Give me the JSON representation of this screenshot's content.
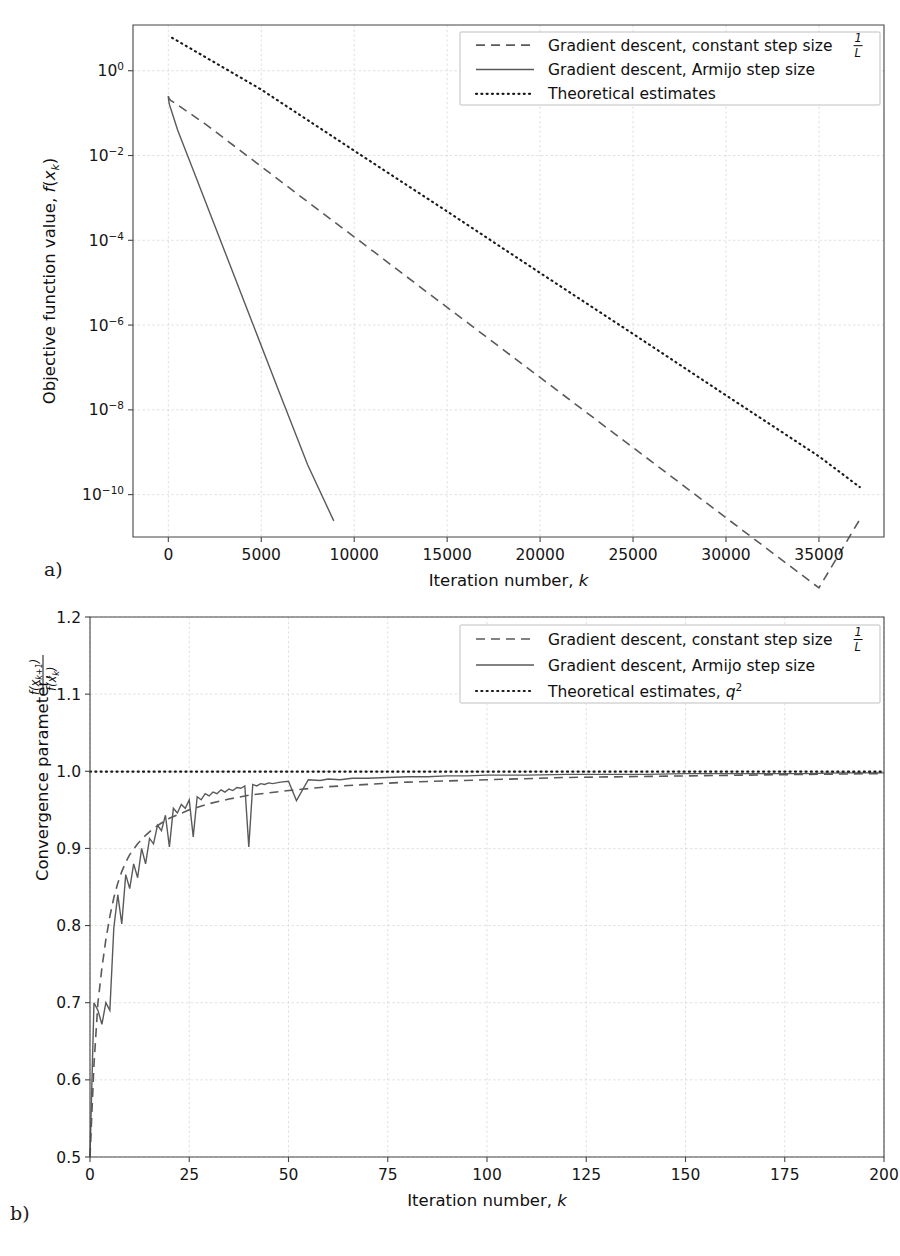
{
  "figure": {
    "panels": [
      {
        "key": "a",
        "label": "a)",
        "legend_items": [
          {
            "style": "dashed",
            "label": "Gradient descent, constant step size",
            "suffix_fraction": {
              "numerator": "1",
              "denominator": "L"
            }
          },
          {
            "style": "solid",
            "label": "Gradient descent, Armijo step size",
            "suffix_fraction": null
          },
          {
            "style": "dotted",
            "label": "Theoretical estimates",
            "suffix_fraction": null
          }
        ]
      },
      {
        "key": "b",
        "label": "b)",
        "legend_items": [
          {
            "style": "dashed",
            "label": "Gradient descent, constant step size",
            "suffix_fraction": {
              "numerator": "1",
              "denominator": "L"
            }
          },
          {
            "style": "solid",
            "label": "Gradient descent, Armijo step size",
            "suffix_fraction": null
          },
          {
            "style": "dotted",
            "label": "Theoretical estimates, q²",
            "suffix_fraction": null
          }
        ]
      }
    ]
  },
  "chart_data": [
    {
      "panel": "a",
      "type": "line",
      "title": "",
      "xlabel": "Iteration number, k",
      "ylabel": "Objective function value, f(xₖ)",
      "yscale": "log",
      "xscale": "linear",
      "xlim": [
        -1900,
        38500
      ],
      "ylim": [
        1e-11,
        12
      ],
      "xticks": [
        0,
        5000,
        10000,
        15000,
        20000,
        25000,
        30000,
        35000
      ],
      "xticklabels": [
        "0",
        "5000",
        "10000",
        "15000",
        "20000",
        "25000",
        "30000",
        "35000"
      ],
      "yticks": [
        1,
        0.01,
        0.0001,
        1e-06,
        1e-08,
        1e-10
      ],
      "yticklabels": [
        "10⁰",
        "10⁻²",
        "10⁻⁴",
        "10⁻⁶",
        "10⁻⁸",
        "10⁻¹⁰"
      ],
      "grid": true,
      "legend_position": "upper right",
      "series": [
        {
          "name": "Gradient descent, constant step size 1/L",
          "style": "dashed",
          "color": "#5a5a5a",
          "x": [
            0,
            40,
            120,
            300,
            2000,
            5000,
            8000,
            11000,
            14000,
            17000,
            20000,
            23000,
            26000,
            29000,
            32000,
            35000,
            37200
          ],
          "y": [
            0.25,
            0.22,
            0.2,
            0.18,
            0.055,
            0.0055,
            0.00055,
            5.6e-05,
            5.6e-06,
            5.7e-07,
            5.8e-08,
            5.9e-09,
            6e-10,
            6.1e-11,
            6.2e-12,
            6.3e-13,
            2.6e-11
          ]
        },
        {
          "name": "Gradient descent, Armijo step size",
          "style": "solid",
          "color": "#5a5a5a",
          "x": [
            0,
            20,
            60,
            150,
            500,
            1500,
            3000,
            4500,
            6000,
            7500,
            8900
          ],
          "y": [
            0.25,
            0.2,
            0.16,
            0.12,
            0.04,
            0.003,
            6e-05,
            1.2e-06,
            2.4e-08,
            5e-10,
            2.4e-11
          ]
        },
        {
          "name": "Theoretical estimates",
          "style": "dotted",
          "color": "#1a1a1a",
          "x": [
            200,
            5000,
            10000,
            15000,
            20000,
            25000,
            30000,
            35000,
            37200
          ],
          "y": [
            6.0,
            0.36,
            0.013,
            0.00048,
            1.7e-05,
            6.2e-07,
            2.2e-08,
            8e-10,
            1.5e-10
          ]
        }
      ]
    },
    {
      "panel": "b",
      "type": "line",
      "title": "",
      "xlabel": "Iteration number, k",
      "ylabel": "Convergence parameter, f(xₖ₊₁)/f(xₖ)",
      "yscale": "linear",
      "xscale": "linear",
      "xlim": [
        0,
        200
      ],
      "ylim": [
        0.5,
        1.2
      ],
      "xticks": [
        0,
        25,
        50,
        75,
        100,
        125,
        150,
        175,
        200
      ],
      "xticklabels": [
        "0",
        "25",
        "50",
        "75",
        "100",
        "125",
        "150",
        "175",
        "200"
      ],
      "yticks": [
        0.5,
        0.6,
        0.7,
        0.8,
        0.9,
        1.0,
        1.1,
        1.2
      ],
      "yticklabels": [
        "0.5",
        "0.6",
        "0.7",
        "0.8",
        "0.9",
        "1.0",
        "1.1",
        "1.2"
      ],
      "grid": true,
      "legend_position": "upper right",
      "series": [
        {
          "name": "Gradient descent, constant step size 1/L",
          "style": "dashed",
          "color": "#5a5a5a",
          "x": [
            0,
            1,
            2,
            3,
            4,
            5,
            6,
            7,
            8,
            9,
            10,
            12,
            14,
            16,
            18,
            20,
            25,
            30,
            35,
            40,
            50,
            60,
            70,
            80,
            100,
            120,
            150,
            180,
            200
          ],
          "y": [
            0.5,
            0.62,
            0.7,
            0.745,
            0.782,
            0.812,
            0.836,
            0.855,
            0.87,
            0.882,
            0.892,
            0.906,
            0.917,
            0.926,
            0.933,
            0.939,
            0.95,
            0.958,
            0.964,
            0.969,
            0.975,
            0.98,
            0.983,
            0.986,
            0.989,
            0.992,
            0.994,
            0.996,
            0.997
          ]
        },
        {
          "name": "Gradient descent, Armijo step size",
          "style": "solid",
          "color": "#5a5a5a",
          "x": [
            0,
            1,
            2,
            3,
            4,
            5,
            6,
            7,
            8,
            9,
            10,
            11,
            12,
            13,
            14,
            15,
            16,
            17,
            18,
            19,
            20,
            21,
            22,
            23,
            24,
            25,
            26,
            27,
            28,
            29,
            30,
            31,
            32,
            33,
            34,
            35,
            36,
            37,
            38,
            39,
            40,
            41,
            42,
            43,
            44,
            45,
            46,
            48,
            50,
            52,
            55,
            58,
            60,
            63,
            66,
            70,
            75,
            80,
            85,
            90,
            95,
            100,
            110,
            120,
            130,
            140,
            150,
            160,
            170,
            180,
            190,
            200
          ],
          "y": [
            0.5,
            0.7,
            0.69,
            0.672,
            0.7,
            0.69,
            0.797,
            0.84,
            0.802,
            0.866,
            0.848,
            0.88,
            0.862,
            0.9,
            0.88,
            0.913,
            0.906,
            0.93,
            0.923,
            0.943,
            0.902,
            0.952,
            0.946,
            0.957,
            0.952,
            0.963,
            0.915,
            0.967,
            0.963,
            0.971,
            0.968,
            0.973,
            0.971,
            0.976,
            0.973,
            0.977,
            0.975,
            0.979,
            0.978,
            0.981,
            0.902,
            0.983,
            0.981,
            0.984,
            0.983,
            0.985,
            0.984,
            0.986,
            0.987,
            0.962,
            0.989,
            0.988,
            0.99,
            0.989,
            0.991,
            0.991,
            0.992,
            0.993,
            0.993,
            0.994,
            0.994,
            0.995,
            0.995,
            0.996,
            0.996,
            0.996,
            0.997,
            0.997,
            0.997,
            0.997,
            0.998,
            0.998
          ]
        },
        {
          "name": "Theoretical estimates, q²",
          "style": "dotted",
          "color": "#1a1a1a",
          "x": [
            0,
            200
          ],
          "y": [
            0.9995,
            0.9995
          ]
        }
      ]
    }
  ]
}
